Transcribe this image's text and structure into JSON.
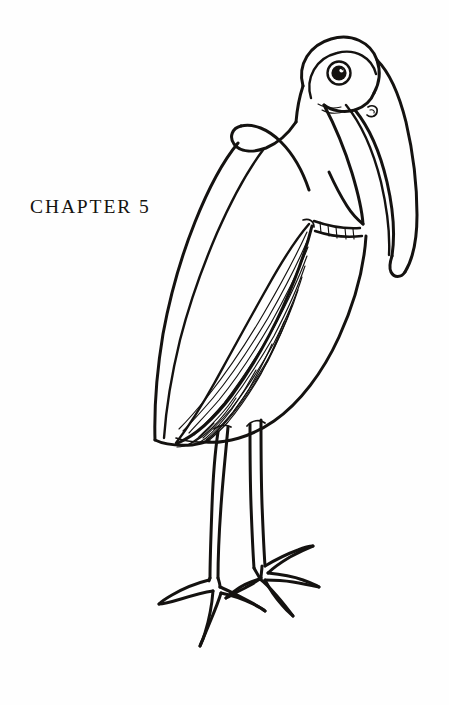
{
  "page": {
    "background_color": "#fefefe",
    "ink_color": "#141210",
    "width": 449,
    "height": 705
  },
  "chapter": {
    "label": "CHAPTER 5",
    "number": "5",
    "word": "CHAPTER"
  },
  "illustration": {
    "title": "Pen and ink drawing of a long-legged wading bird",
    "subject": "wood stork / ibis-like wading bird standing in profile facing right",
    "style": "black ink line drawing on white paper",
    "parts": [
      {
        "name": "head",
        "description": "rounded dome-shaped head at upper right"
      },
      {
        "name": "eye",
        "description": "large circular eye with dark spiral pupil"
      },
      {
        "name": "nostril",
        "description": "small curled mark on upper beak"
      },
      {
        "name": "beak",
        "description": "long heavy down-curved bill tapering to rounded tip"
      },
      {
        "name": "neck",
        "description": "thick S-curved neck with collar band"
      },
      {
        "name": "collar-band",
        "description": "short hatched band across lower neck"
      },
      {
        "name": "body",
        "description": "ovoid body with back sloping to pointed tail"
      },
      {
        "name": "wing",
        "description": "long leaf-shaped wing filled with parallel hatch lines"
      },
      {
        "name": "left-leg",
        "description": "thin straight leg, front"
      },
      {
        "name": "right-leg",
        "description": "thin straight leg, rear"
      },
      {
        "name": "left-foot",
        "description": "splayed foot with four long toes"
      },
      {
        "name": "right-foot",
        "description": "splayed foot with four long toes, behind"
      }
    ]
  }
}
